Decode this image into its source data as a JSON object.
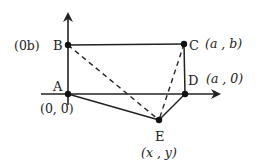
{
  "diagram": {
    "type": "coordinate-geometry-figure",
    "colors": {
      "ink": "#222222",
      "background": "#ffffff"
    },
    "axes": {
      "x_axis": {
        "from": [
          41,
          94
        ],
        "to": [
          221,
          94
        ],
        "arrow": true
      },
      "y_axis": {
        "from": [
          68,
          105
        ],
        "to": [
          68,
          12
        ],
        "arrow": true
      }
    },
    "points": [
      {
        "id": "A",
        "label": "A",
        "coord_label": "(0, 0)",
        "pos": [
          68,
          94
        ]
      },
      {
        "id": "B",
        "label": "B",
        "coord_label": "(0b)",
        "pos": [
          68,
          45
        ]
      },
      {
        "id": "C",
        "label": "C",
        "coord_label": "(a , b)",
        "pos": [
          184,
          44
        ]
      },
      {
        "id": "D",
        "label": "D",
        "coord_label": "(a , 0)",
        "pos": [
          185,
          94
        ]
      },
      {
        "id": "E",
        "label": "E",
        "coord_label": "(x , y)",
        "pos": [
          159,
          120
        ]
      }
    ],
    "segments": [
      {
        "from": "B",
        "to": "C",
        "style": "solid"
      },
      {
        "from": "C",
        "to": "D",
        "style": "solid"
      },
      {
        "from": "A",
        "to": "E",
        "style": "solid"
      },
      {
        "from": "E",
        "to": "D",
        "style": "solid"
      },
      {
        "from": "B",
        "to": "E",
        "style": "dashed"
      },
      {
        "from": "C",
        "to": "E",
        "style": "dashed"
      }
    ]
  }
}
